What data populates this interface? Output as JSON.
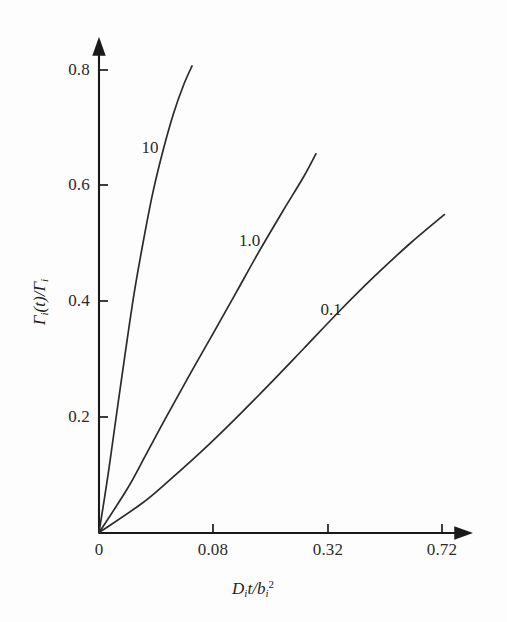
{
  "figure": {
    "background_color": "#fdfdfd",
    "line_color": "#2b2b2b",
    "axis_color": "#1a1a1a"
  },
  "axes": {
    "x_title_html": "D<sub>i</sub>t/b<sub>i</sub><sup>2</sup>",
    "x_title_text": "Dit/bi2",
    "y_title_text": "Γi(t)/Γi",
    "x_ticks": [
      "0",
      "0.08",
      "0.32",
      "0.72"
    ],
    "y_ticks": [
      "0.2",
      "0.4",
      "0.6",
      "0.8"
    ]
  },
  "curve_labels": [
    {
      "text": "10"
    },
    {
      "text": "1.0"
    },
    {
      "text": "0.1"
    }
  ],
  "chart_data": {
    "type": "line",
    "title": "",
    "xlabel": "D_i t / b_i^2",
    "ylabel": "Gamma_i(t)/Gamma_i",
    "xlim": [
      0,
      0.82
    ],
    "ylim": [
      0,
      0.88
    ],
    "x_tick_values": [
      0,
      0.08,
      0.32,
      0.72
    ],
    "y_tick_values": [
      0.2,
      0.4,
      0.6,
      0.8
    ],
    "x_axis_scale": "square-root (ticks 0, 0.08, 0.32, 0.72 equally spaced)",
    "grid": false,
    "legend": "inline curve annotations",
    "series": [
      {
        "name": "10",
        "label_position": {
          "x": 0.016,
          "y": 0.665
        },
        "points": [
          {
            "x": 0.0,
            "y": 0.0
          },
          {
            "x": 0.0005,
            "y": 0.1
          },
          {
            "x": 0.0018,
            "y": 0.2
          },
          {
            "x": 0.0042,
            "y": 0.31
          },
          {
            "x": 0.0074,
            "y": 0.41
          },
          {
            "x": 0.0118,
            "y": 0.5
          },
          {
            "x": 0.0175,
            "y": 0.585
          },
          {
            "x": 0.025,
            "y": 0.66
          },
          {
            "x": 0.034,
            "y": 0.725
          },
          {
            "x": 0.044,
            "y": 0.775
          },
          {
            "x": 0.053,
            "y": 0.807
          }
        ]
      },
      {
        "name": "1.0",
        "label_position": {
          "x": 0.139,
          "y": 0.505
        },
        "points": [
          {
            "x": 0.0,
            "y": 0.0
          },
          {
            "x": 0.0048,
            "y": 0.075
          },
          {
            "x": 0.0135,
            "y": 0.135
          },
          {
            "x": 0.029,
            "y": 0.205
          },
          {
            "x": 0.051,
            "y": 0.275
          },
          {
            "x": 0.08,
            "y": 0.345
          },
          {
            "x": 0.115,
            "y": 0.415
          },
          {
            "x": 0.156,
            "y": 0.485
          },
          {
            "x": 0.206,
            "y": 0.555
          },
          {
            "x": 0.256,
            "y": 0.615
          },
          {
            "x": 0.288,
            "y": 0.655
          }
        ]
      },
      {
        "name": "0.1",
        "label_position": {
          "x": 0.33,
          "y": 0.385
        },
        "points": [
          {
            "x": 0.0,
            "y": 0.0
          },
          {
            "x": 0.011,
            "y": 0.05
          },
          {
            "x": 0.03,
            "y": 0.09
          },
          {
            "x": 0.064,
            "y": 0.14
          },
          {
            "x": 0.112,
            "y": 0.195
          },
          {
            "x": 0.176,
            "y": 0.255
          },
          {
            "x": 0.256,
            "y": 0.318
          },
          {
            "x": 0.352,
            "y": 0.382
          },
          {
            "x": 0.464,
            "y": 0.443
          },
          {
            "x": 0.592,
            "y": 0.5
          },
          {
            "x": 0.73,
            "y": 0.55
          }
        ]
      }
    ]
  }
}
